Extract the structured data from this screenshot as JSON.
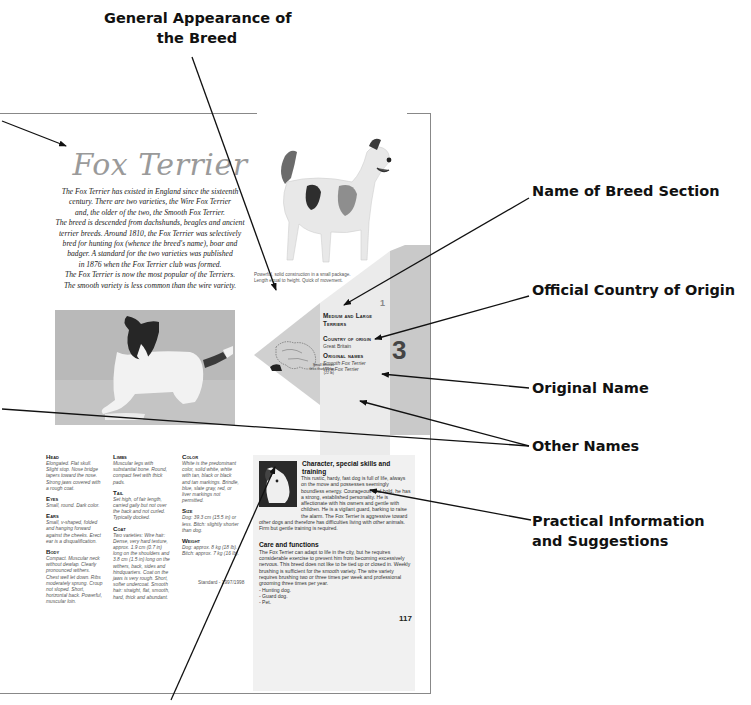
{
  "callouts": {
    "general_appearance": [
      "General Appearance of",
      "the Breed"
    ],
    "name_of_breed_section": "Name of Breed Section",
    "official_country_of_origin": "Official Country of Origin",
    "original_name": "Original Name",
    "other_names": "Other Names",
    "practical_information": [
      "Practical Information",
      "and Suggestions"
    ]
  },
  "page": {
    "breed_title": "Fox Terrier",
    "intro_lines": [
      "The Fox Terrier has existed in England since the sixteenth",
      "century. There are two varieties, the Wire Fox Terrier",
      "and, the older of the two, the Smooth Fox Terrier.",
      "The breed is descended from dachshunds, beagles and ancient",
      "terrier breeds. Around 1810, the Fox Terrier was selectively",
      "bred for hunting fox (whence the breed's name), boar and",
      "badger. A standard for the two varieties was published",
      "in 1876 when the Fox Terrier club was formed.",
      "The Fox Terrier is now the most popular of the Terriers.",
      "The smooth variety is less common than the wire variety."
    ],
    "photo_caption": [
      "Powerful, solid construction in a small package.",
      "Length equal to height. Quick of movement."
    ],
    "section_number": "1",
    "group_number": "3",
    "section_name": [
      "Medium and Large",
      "Terriers"
    ],
    "country_label": "Country of origin",
    "country_value": "Great Britain",
    "original_names_label": "Original names",
    "original_names": [
      "Smooth Fox Terrier",
      "Wire Fox Terrier"
    ],
    "map_label": [
      "Small Breeds",
      "less than 10 kg",
      "(22 lb)"
    ],
    "standard": "Standard - 1997/1998",
    "page_number": "117"
  },
  "standard_columns": [
    [
      {
        "heading": "Head",
        "text": "Elongated. Flat skull. Slight stop. Nose bridge tapers toward the nose. Strong jaws covered with a rough coat."
      },
      {
        "heading": "Eyes",
        "text": "Small, round. Dark color."
      },
      {
        "heading": "Ears",
        "text": "Small, v-shaped, folded and hanging forward against the cheeks. Erect ear is a disqualification."
      },
      {
        "heading": "Body",
        "text": "Compact. Muscular neck without dewlap. Clearly pronounced withers. Chest well let down. Ribs moderately sprung. Croup not sloped. Short, horizontal back. Powerful, muscular loin."
      }
    ],
    [
      {
        "heading": "Limbs",
        "text": "Muscular legs with substantial bone. Round, compact feet with thick pads."
      },
      {
        "heading": "Tail",
        "text": "Set high, of fair length, carried gaily but not over the back and not curled. Typically docked."
      },
      {
        "heading": "Coat",
        "text": "Two varieties: Wire hair: Dense, very hard texture, approx. 1.9 cm (0.7 in) long on the shoulders and 3.8 cm (1.5 in) long on the withers, back, sides and hindquarters. Coat on the jaws is very rough. Short, softer undercoat. Smooth hair: straight, flat, smooth, hard, thick and abundant."
      }
    ],
    [
      {
        "heading": "Color",
        "text": "White is the predominant color, solid white, white with tan, black or black and tan markings. Brindle, blue, slate gray, red, or liver markings not permitted."
      },
      {
        "heading": "Size",
        "text": "Dog: 39.3 cm (15.5 in) or less. Bitch: slightly shorter than dog."
      },
      {
        "heading": "Weight",
        "text": "Dog: approx. 8 kg (18 lb). Bitch: approx. 7 kg (16 lb)."
      }
    ]
  ],
  "practical": {
    "character_heading": "Character, special skills and training",
    "character_text": "This rustic, hardy, fast dog is full of life, always on the move and possesses seemingly boundless energy. Courageous and bold, he has a strong, established personality. He is affectionate with his owners and gentle with children. He is a vigilant guard, barking to raise the alarm. The Fox Terrier is aggressive toward other dogs and therefore has difficulties living with other animals. Firm but gentle training is required.",
    "care_heading": "Care and functions",
    "care_text": "The Fox Terrier can adapt to life in the city, but he requires considerable exercise to prevent him from becoming excessively nervous. This breed does not like to be tied up or closed in. Weekly brushing is sufficient for the smooth variety. The wire variety requires brushing two or three times per week and professional grooming three times per year.",
    "functions": [
      "- Hunting dog.",
      "- Guard dog.",
      "- Pet."
    ]
  }
}
